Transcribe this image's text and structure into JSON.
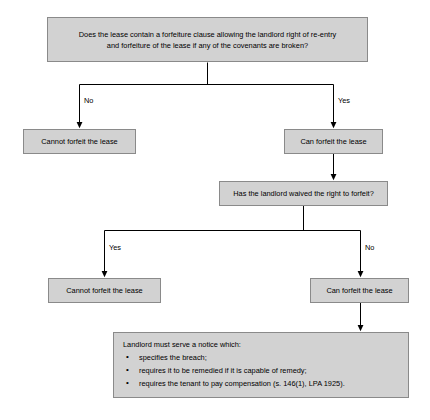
{
  "diagram": {
    "style": {
      "node_fill": "#d2d2d2",
      "node_border": "#8a8a8a",
      "line_color": "#000000",
      "background": "#ffffff",
      "text_color": "#000000"
    },
    "nodes": {
      "q1": "Does the lease contain a forfeiture clause allowing the landlord right of re-entry and forfeiture of the lease if any of the covenants are broken?",
      "q1_line1": "Does the lease contain a forfeiture clause allowing the landlord right of re-entry",
      "q1_line2": "and forfeiture of the lease if any of the covenants are broken?",
      "no_forfeit_1": "Cannot forfeit the lease",
      "can_forfeit_1": "Can forfeit the lease",
      "q2": "Has the landlord waived the right to forfeit?",
      "no_forfeit_2": "Cannot forfeit the lease",
      "can_forfeit_2": "Can forfeit the lease",
      "notice_heading": "Landlord must serve a notice which:",
      "notice_bullets": [
        "specifies the breach;",
        "requires it to be remedied if it is capable of remedy;",
        "requires the tenant to pay compensation (s. 146(1), LPA 1925)."
      ]
    },
    "edge_labels": {
      "q1_no": "No",
      "q1_yes": "Yes",
      "q2_yes": "Yes",
      "q2_no": "No"
    }
  }
}
